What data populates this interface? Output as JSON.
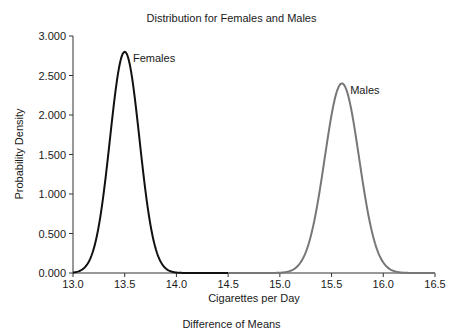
{
  "chart_data": {
    "type": "line",
    "title": "Distribution for Females and Males",
    "xlabel": "Cigarettes per Day",
    "ylabel": "Probability Density",
    "caption": "Difference of Means",
    "xlim": [
      13.0,
      16.5
    ],
    "ylim": [
      0.0,
      3.0
    ],
    "x_ticks": [
      "13.0",
      "13.5",
      "14.0",
      "14.5",
      "15.0",
      "15.5",
      "16.0",
      "16.5"
    ],
    "y_ticks": [
      "0.000",
      "0.500",
      "1.000",
      "1.500",
      "2.000",
      "2.500",
      "3.000"
    ],
    "grid": false,
    "legend": "inline annotations",
    "series": [
      {
        "name": "Females",
        "color": "#111111",
        "distribution": "normal",
        "mean": 13.5,
        "peak_density": 2.8,
        "x_range": [
          13.0,
          14.5
        ],
        "x": [
          13.0,
          13.1,
          13.2,
          13.3,
          13.4,
          13.5,
          13.6,
          13.7,
          13.8,
          13.9,
          14.0,
          14.5
        ],
        "values": [
          0.006,
          0.055,
          0.304,
          1.04,
          2.19,
          2.8,
          2.19,
          1.04,
          0.304,
          0.055,
          0.006,
          0.0
        ]
      },
      {
        "name": "Males",
        "color": "#777777",
        "distribution": "normal",
        "mean": 15.6,
        "peak_density": 2.4,
        "x_range": [
          14.5,
          16.5
        ],
        "x": [
          14.5,
          15.0,
          15.1,
          15.2,
          15.3,
          15.4,
          15.5,
          15.6,
          15.7,
          15.8,
          15.9,
          16.0,
          16.1,
          16.2,
          16.5
        ],
        "values": [
          0.0,
          0.003,
          0.026,
          0.14,
          0.47,
          1.16,
          2.02,
          2.4,
          2.02,
          1.16,
          0.47,
          0.14,
          0.026,
          0.003,
          0.0
        ]
      }
    ],
    "annotations": [
      {
        "text": "Females",
        "x": 13.58,
        "y": 2.72
      },
      {
        "text": "Males",
        "x": 15.68,
        "y": 2.32
      }
    ]
  }
}
